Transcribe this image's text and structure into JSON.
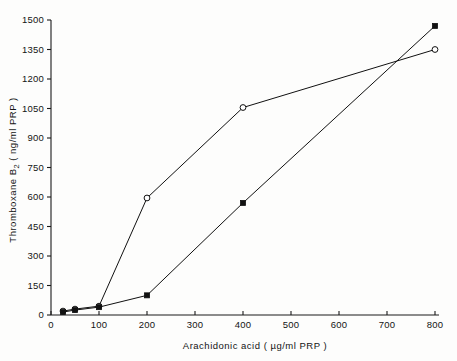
{
  "chart_data": {
    "type": "line",
    "title": "",
    "subtitle": "",
    "xlabel": "Arachidonic  acid  ( µg/ml  PRP )",
    "ylabel": "Thromboxane  B₂  ( ng/ml  PRP )",
    "ylabel_main": "Thromboxane  B",
    "ylabel_sub": "2",
    "ylabel_units": "( ng/ml  PRP )",
    "xlim": [
      0,
      800
    ],
    "ylim": [
      0,
      1500
    ],
    "xticks": [
      0,
      100,
      200,
      300,
      400,
      500,
      600,
      700,
      800
    ],
    "xtick_labels": [
      "0",
      "100",
      "200",
      "300",
      "400",
      "500",
      "600",
      "700",
      "800"
    ],
    "yticks": [
      0,
      150,
      300,
      450,
      600,
      750,
      900,
      1050,
      1200,
      1350,
      1500
    ],
    "ytick_labels": [
      "0",
      "150",
      "300",
      "450",
      "600",
      "750",
      "900",
      "1050",
      "1200",
      "1350",
      "1500"
    ],
    "grid": false,
    "legend": "none",
    "series": [
      {
        "name": "open-circle-series",
        "marker": "open-circle",
        "x": [
          25,
          50,
          100,
          200,
          400,
          800
        ],
        "values": [
          20,
          30,
          45,
          595,
          1055,
          1350
        ]
      },
      {
        "name": "filled-square-series",
        "marker": "filled-square",
        "x": [
          25,
          50,
          100,
          200,
          400,
          800
        ],
        "values": [
          15,
          25,
          40,
          100,
          570,
          1470
        ]
      }
    ]
  },
  "colors": {
    "ink": "#111111",
    "background": "#fdfdfc"
  }
}
